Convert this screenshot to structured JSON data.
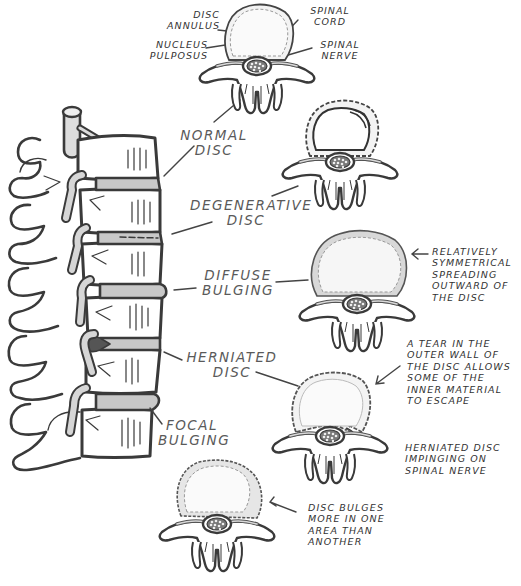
{
  "anatomy_labels": {
    "disc_annulus": "DISC\nANNULUS",
    "nucleus_pulposus": "NUCLEUS\nPULPOSUS",
    "spinal_cord": "SPINAL\nCORD",
    "spinal_nerve": "SPINAL\nNERVE"
  },
  "conditions": [
    {
      "id": "normal",
      "label": "NORMAL\nDISC"
    },
    {
      "id": "degenerative",
      "label": "DEGENERATIVE\nDISC"
    },
    {
      "id": "diffuse",
      "label": "DIFFUSE\nBULGING"
    },
    {
      "id": "herniated",
      "label": "HERNIATED\nDISC"
    },
    {
      "id": "focal",
      "label": "FOCAL\nBULGING"
    }
  ],
  "notes": {
    "diffuse": "RELATIVELY\nSYMMETRICAL\nSPREADING\nOUTWARD OF\nTHE DISC",
    "herniated_tear": "A TEAR IN THE\nOUTER WALL OF\nTHE DISC ALLOWS\nSOME OF THE\nINNER MATERIAL\nTO ESCAPE",
    "herniated_impinge": "HERNIATED DISC\nIMPINGING ON\nSPINAL NERVE",
    "focal": "DISC BULGES\nMORE IN ONE\nAREA THAN\nANOTHER"
  },
  "colors": {
    "ink": "#3a3a3a",
    "label": "#5a5a5a",
    "disc_fill": "#f2f2f2",
    "bone_fill": "#ffffff",
    "shade": "#c8c8c8"
  }
}
